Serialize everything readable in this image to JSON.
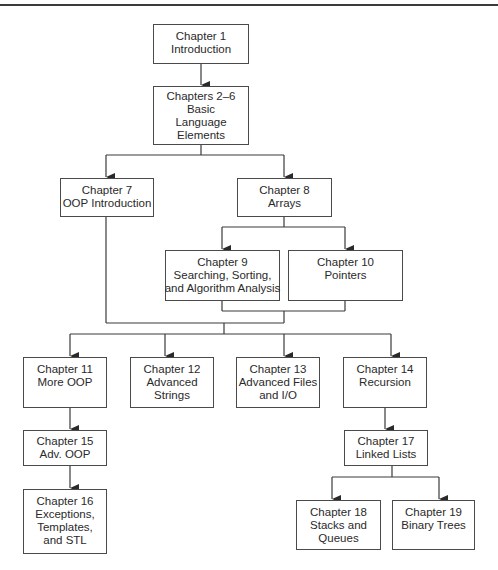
{
  "diagram": {
    "type": "chapter-dependency-flowchart",
    "colors": {
      "line": "#3a3a3a",
      "box_border": "#4a4a4a",
      "text": "#2a2a2a",
      "background": "#ffffff"
    },
    "nodes": [
      {
        "id": "ch1",
        "lines": [
          "Chapter 1",
          "Introduction"
        ]
      },
      {
        "id": "ch2_6",
        "lines": [
          "Chapters 2–6",
          "Basic",
          "Language",
          "Elements"
        ]
      },
      {
        "id": "ch7",
        "lines": [
          "Chapter 7",
          "OOP Introduction"
        ]
      },
      {
        "id": "ch8",
        "lines": [
          "Chapter 8",
          "Arrays"
        ]
      },
      {
        "id": "ch9",
        "lines": [
          "Chapter 9",
          "Searching, Sorting,",
          "and Algorithm Analysis"
        ]
      },
      {
        "id": "ch10",
        "lines": [
          "Chapter 10",
          "Pointers"
        ]
      },
      {
        "id": "ch11",
        "lines": [
          "Chapter 11",
          "More OOP"
        ]
      },
      {
        "id": "ch12",
        "lines": [
          "Chapter 12",
          "Advanced",
          "Strings"
        ]
      },
      {
        "id": "ch13",
        "lines": [
          "Chapter 13",
          "Advanced Files",
          "and I/O"
        ]
      },
      {
        "id": "ch14",
        "lines": [
          "Chapter 14",
          "Recursion"
        ]
      },
      {
        "id": "ch15",
        "lines": [
          "Chapter 15",
          "Adv. OOP"
        ]
      },
      {
        "id": "ch16",
        "lines": [
          "Chapter 16",
          "Exceptions,",
          "Templates,",
          "and STL"
        ]
      },
      {
        "id": "ch17",
        "lines": [
          "Chapter 17",
          "Linked Lists"
        ]
      },
      {
        "id": "ch18",
        "lines": [
          "Chapter 18",
          "Stacks and",
          "Queues"
        ]
      },
      {
        "id": "ch19",
        "lines": [
          "Chapter 19",
          "Binary Trees"
        ]
      }
    ],
    "edges": [
      [
        "ch1",
        "ch2_6"
      ],
      [
        "ch2_6",
        "ch7"
      ],
      [
        "ch2_6",
        "ch8"
      ],
      [
        "ch8",
        "ch9"
      ],
      [
        "ch8",
        "ch10"
      ],
      [
        "ch7+ch9+ch10",
        "ch11"
      ],
      [
        "ch7+ch9+ch10",
        "ch12"
      ],
      [
        "ch7+ch9+ch10",
        "ch13"
      ],
      [
        "ch7+ch9+ch10",
        "ch14"
      ],
      [
        "ch11",
        "ch15"
      ],
      [
        "ch15",
        "ch16"
      ],
      [
        "ch14",
        "ch17"
      ],
      [
        "ch17",
        "ch18"
      ],
      [
        "ch17",
        "ch19"
      ]
    ]
  }
}
